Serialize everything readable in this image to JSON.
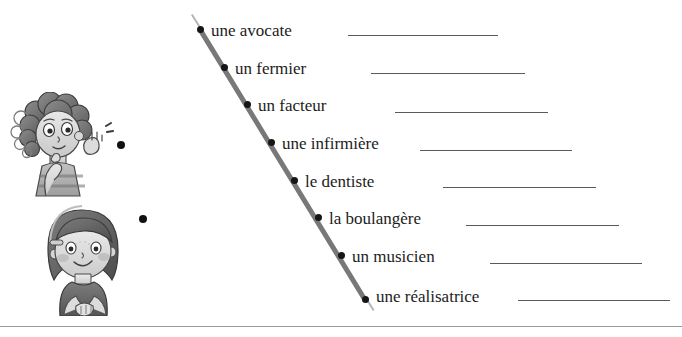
{
  "worksheet": {
    "title": "Les métiers — exercice à relier",
    "colors": {
      "diagonal": "#787878",
      "dot": "#161616",
      "rule": "#59595e",
      "page_rule": "#9a9a9a",
      "text": "#1c1c1c"
    }
  },
  "illustrations": [
    {
      "name": "boy-thinking",
      "alt": "Garçon aux cheveux bouclés, main au menton, l'autre main levée"
    },
    {
      "name": "girl-smiling",
      "alt": "Fille aux cheveux courts avec barrette, mains jointes"
    }
  ],
  "left_dots": [
    {
      "label": "left-bullet-1"
    },
    {
      "label": "left-bullet-2"
    }
  ],
  "items": [
    {
      "label": "une avocate",
      "dot_x": 200,
      "dot_y": 29,
      "text_x": 211,
      "text_y": 22,
      "rule_x": 348,
      "rule_y": 35,
      "rule_w": 150
    },
    {
      "label": "un fermier",
      "dot_x": 224,
      "dot_y": 67,
      "text_x": 235,
      "text_y": 60,
      "rule_x": 371,
      "rule_y": 73,
      "rule_w": 154
    },
    {
      "label": "un facteur",
      "dot_x": 247,
      "dot_y": 104,
      "text_x": 258,
      "text_y": 97,
      "rule_x": 395,
      "rule_y": 112,
      "rule_w": 153
    },
    {
      "label": "une infirmière",
      "dot_x": 271,
      "dot_y": 142,
      "text_x": 282,
      "text_y": 135,
      "rule_x": 420,
      "rule_y": 150,
      "rule_w": 152
    },
    {
      "label": "le dentiste",
      "dot_x": 294,
      "dot_y": 180,
      "text_x": 305,
      "text_y": 173,
      "rule_x": 443,
      "rule_y": 187,
      "rule_w": 153
    },
    {
      "label": "la boulangère",
      "dot_x": 318,
      "dot_y": 217,
      "text_x": 329,
      "text_y": 210,
      "rule_x": 466,
      "rule_y": 225,
      "rule_w": 153
    },
    {
      "label": "un musicien",
      "dot_x": 341,
      "dot_y": 255,
      "text_x": 352,
      "text_y": 248,
      "rule_x": 490,
      "rule_y": 263,
      "rule_w": 152
    },
    {
      "label": "une réalisatrice",
      "dot_x": 365,
      "dot_y": 299,
      "text_x": 376,
      "text_y": 288,
      "rule_x": 518,
      "rule_y": 300,
      "rule_w": 152
    }
  ]
}
